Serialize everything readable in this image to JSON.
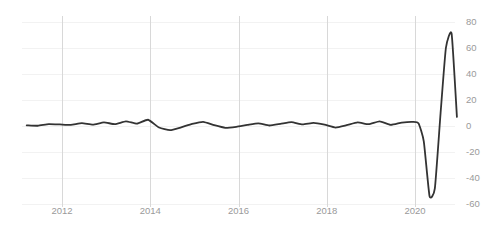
{
  "chart_data": {
    "type": "line",
    "title": "",
    "subtitle": "",
    "xlabel": "",
    "ylabel": "",
    "xlim": [
      2011.2,
      2021.05
    ],
    "ylim": [
      -60,
      80
    ],
    "grid": true,
    "legend": null,
    "legend_position": "none",
    "line_color": "#333333",
    "grid_color_vertical": "#d8d8d8",
    "grid_color_horizontal": "#f2f2f2",
    "tick_label_color": "#9a9a9a",
    "x_ticks": [
      2012,
      2014,
      2016,
      2018,
      2020
    ],
    "x_tick_labels": [
      "2012",
      "2014",
      "2016",
      "2018",
      "2020"
    ],
    "y_ticks": [
      80,
      60,
      40,
      20,
      0,
      -20,
      -40,
      -60
    ],
    "y_tick_labels": [
      "80",
      "60",
      "40",
      "20",
      "0",
      "-20",
      "-40",
      "-60"
    ],
    "series": [
      {
        "name": "",
        "x": [
          2011.2,
          2011.45,
          2011.7,
          2011.95,
          2012.2,
          2012.45,
          2012.7,
          2012.95,
          2013.2,
          2013.45,
          2013.7,
          2013.95,
          2014.2,
          2014.45,
          2014.7,
          2014.95,
          2015.2,
          2015.45,
          2015.7,
          2015.95,
          2016.2,
          2016.45,
          2016.7,
          2016.95,
          2017.2,
          2017.45,
          2017.7,
          2017.95,
          2018.2,
          2018.45,
          2018.7,
          2018.95,
          2019.2,
          2019.45,
          2019.7,
          2019.95,
          2020.08,
          2020.2,
          2020.33,
          2020.45,
          2020.58,
          2020.7,
          2020.83,
          2020.95
        ],
        "y": [
          0.5,
          0.2,
          1.5,
          1.2,
          0.8,
          2.2,
          1.0,
          2.8,
          1.4,
          3.6,
          1.8,
          4.8,
          -1.2,
          -3.2,
          -1.0,
          1.6,
          3.2,
          0.6,
          -1.4,
          -0.6,
          0.8,
          2.0,
          0.4,
          1.6,
          3.0,
          1.2,
          2.4,
          1.0,
          -1.2,
          0.6,
          2.8,
          1.4,
          3.6,
          0.8,
          2.6,
          3.2,
          2.0,
          -12.0,
          -54.0,
          -48.0,
          10.0,
          60.0,
          71.0,
          7.0
        ]
      }
    ]
  }
}
